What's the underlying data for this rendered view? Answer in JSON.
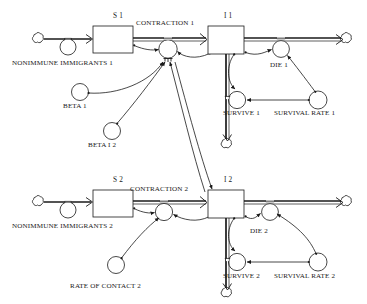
{
  "diagram": {
    "type": "system-dynamics-stock-and-flow",
    "title": "",
    "stocks": [
      {
        "id": "s1",
        "label": "S 1",
        "x": 93,
        "y": 26,
        "w": 40,
        "h": 27
      },
      {
        "id": "i1",
        "label": "I 1",
        "x": 208,
        "y": 26,
        "w": 36,
        "h": 28
      },
      {
        "id": "s2",
        "label": "S 2",
        "x": 93,
        "y": 190,
        "w": 40,
        "h": 27
      },
      {
        "id": "i2",
        "label": "I 2",
        "x": 208,
        "y": 190,
        "w": 36,
        "h": 28
      }
    ],
    "flows": [
      {
        "id": "nonimmune-immigrants-1",
        "label": "NONIMMUNE IMMIGRANTS 1",
        "label_x": 12,
        "label_y": 60
      },
      {
        "id": "contraction-1",
        "label": "CONTRACTION 1",
        "label_x": 136,
        "label_y": 20
      },
      {
        "id": "die-1",
        "label": "DIE 1",
        "label_x": 270,
        "label_y": 62
      },
      {
        "id": "survive-1",
        "label": "SURVIVE 1",
        "label_x": 223,
        "label_y": 110
      },
      {
        "id": "nonimmune-immigrants-2",
        "label": "NONIMMUNE IMMIGRANTS 2",
        "label_x": 12,
        "label_y": 223
      },
      {
        "id": "contraction-2",
        "label": "CONTRACTION 2",
        "label_x": 130,
        "label_y": 186
      },
      {
        "id": "die-2",
        "label": "DIE 2",
        "label_x": 250,
        "label_y": 228
      },
      {
        "id": "survive-2",
        "label": "SURVIVE 2",
        "label_x": 223,
        "label_y": 273
      }
    ],
    "auxiliaries": [
      {
        "id": "beta-1",
        "label": "BETA 1",
        "label_x": 63,
        "label_y": 103
      },
      {
        "id": "beta-i-2",
        "label": "BETA I 2",
        "label_x": 88,
        "label_y": 142
      },
      {
        "id": "survival-rate-1",
        "label": "SURVIVAL RATE 1",
        "label_x": 274,
        "label_y": 110
      },
      {
        "id": "rate-of-contact-2",
        "label": "RATE OF CONTACT 2",
        "label_x": 70,
        "label_y": 283
      },
      {
        "id": "survival-rate-2",
        "label": "SURVIVAL RATE 2",
        "label_x": 274,
        "label_y": 273
      }
    ],
    "sources_sinks": [
      {
        "id": "source-cloud-1",
        "x": 37,
        "y": 39
      },
      {
        "id": "sink-cloud-1",
        "x": 345,
        "y": 39
      },
      {
        "id": "sink-cloud-mid",
        "x": 215,
        "y": 143
      },
      {
        "id": "source-cloud-2",
        "x": 37,
        "y": 202
      },
      {
        "id": "sink-cloud-2",
        "x": 345,
        "y": 202
      },
      {
        "id": "sink-cloud-bottom",
        "x": 215,
        "y": 292
      }
    ],
    "colors": {
      "stroke": "#1a1a1a",
      "background": "#ffffff",
      "text": "#1a1a1a"
    }
  }
}
